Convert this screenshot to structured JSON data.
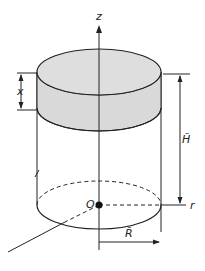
{
  "diagram": {
    "type": "cylinder-coordinate-diagram",
    "labels": {
      "z_axis": "z",
      "r_axis": "r",
      "origin": "O",
      "thickness": "x",
      "height": "H̃",
      "radius": "R̃"
    },
    "colors": {
      "stroke": "#222222",
      "band_fill": "#d9d9d9",
      "background": "#ffffff"
    }
  }
}
